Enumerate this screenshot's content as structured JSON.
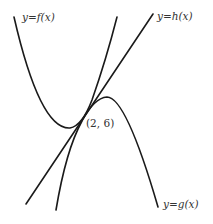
{
  "figure": {
    "labels": {
      "f": "y=f(x)",
      "h": "y=h(x)",
      "g": "y=g(x)",
      "point": "(2, 6)"
    },
    "colors": {
      "stroke": "#1a1a1a",
      "text": "#333333",
      "background": "#ffffff"
    }
  }
}
